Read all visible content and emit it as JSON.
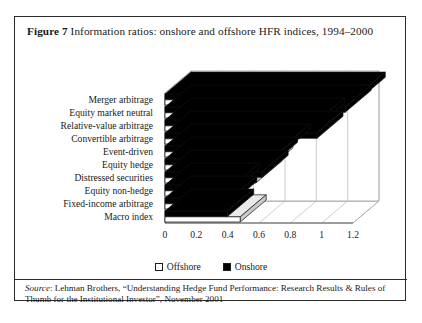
{
  "figure": {
    "label": "Figure",
    "number": "7",
    "title": "Information ratios: onshore and offshore HFR indices, 1994–2000"
  },
  "source": {
    "prefix": "Source",
    "text": ": Lehman Brothers, “Understanding Hedge Fund Performance: Research Results & Rules of Thumb for the Institutional Investor”, November 2001"
  },
  "legend": {
    "position": "bottom-center",
    "items": [
      {
        "label": "Offshore",
        "swatch": "offshore",
        "color": "#ffffff"
      },
      {
        "label": "Onshore",
        "swatch": "onshore",
        "color": "#000000"
      }
    ]
  },
  "chart_data": {
    "type": "bar",
    "orientation": "horizontal",
    "style": "3d-clustered",
    "title": "Information ratios: onshore and offshore HFR indices, 1994–2000",
    "xlabel": "",
    "ylabel": "",
    "xlim": [
      0,
      1.2
    ],
    "xticks": [
      "0",
      "0.2",
      "0.4",
      "0.6",
      "0.8",
      "1",
      "1.2"
    ],
    "xtick_values": [
      0,
      0.2,
      0.4,
      0.6,
      0.8,
      1,
      1.2
    ],
    "grid": true,
    "categories": [
      "Merger arbitrage",
      "Equity market neutral",
      "Relative-value arbitrage",
      "Convertible arbitrage",
      "Event-driven",
      "Equity hedge",
      "Distressed securities",
      "Equity non-hedge",
      "Fixed-income arbitrage",
      "Macro index"
    ],
    "series": [
      {
        "name": "Onshore",
        "color": "#000000",
        "values": [
          1.24,
          1.15,
          0.98,
          0.97,
          0.76,
          0.68,
          0.62,
          0.44,
          0.42,
          0.4
        ]
      },
      {
        "name": "Offshore",
        "color": "#ffffff",
        "values": [
          1.15,
          0.62,
          0.93,
          0.7,
          0.71,
          0.65,
          0.58,
          0.33,
          0.36,
          0.48
        ]
      }
    ]
  }
}
